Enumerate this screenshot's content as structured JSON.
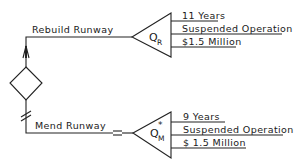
{
  "diagram": {
    "type": "decision-tree",
    "decision_node": {
      "shape": "diamond"
    },
    "branches": [
      {
        "label": "Rebuild Runway",
        "node_symbol": "Q",
        "node_subscript": "R",
        "node_superscript": "",
        "outcomes": [
          "11 Years",
          "Suspended Operation",
          "$1.5 Million"
        ]
      },
      {
        "label": "Mend Runway",
        "node_symbol": "Q",
        "node_subscript": "M",
        "node_superscript": "*",
        "outcomes": [
          "9 Years",
          "Suspended Operation",
          "$ 1.5 Million"
        ]
      }
    ],
    "colors": {
      "line": "#222222",
      "background": "#ffffff"
    }
  }
}
